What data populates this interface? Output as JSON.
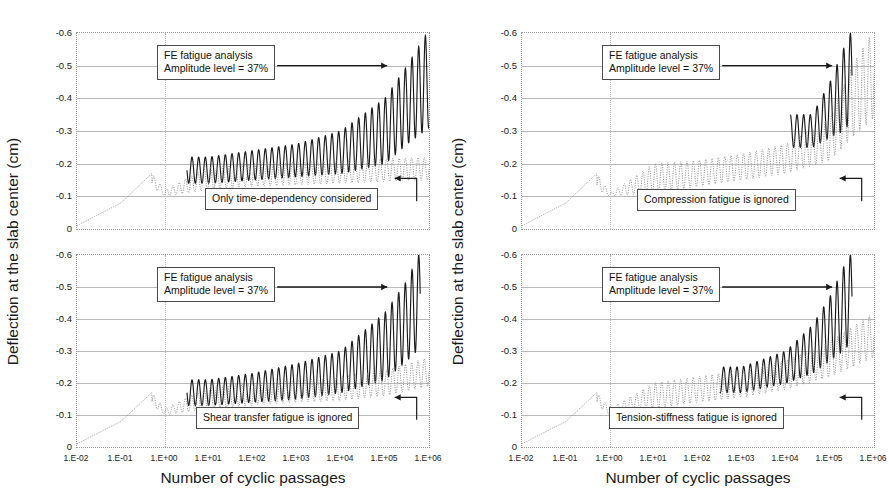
{
  "figure": {
    "width": 889,
    "height": 503,
    "panel_count": 4
  },
  "axes": {
    "ylabel": "Deflection at the slab center (cm)",
    "xlabel": "Number of cyclic passages",
    "yticks": [
      "-0.6",
      "-0.5",
      "-0.4",
      "-0.3",
      "-0.2",
      "-0.1",
      "0"
    ],
    "ytick_values": [
      -0.6,
      -0.5,
      -0.4,
      -0.3,
      -0.2,
      -0.1,
      0
    ],
    "xticks_left": [
      "1.E-02",
      "1.E-01",
      "1.E+00",
      "1.E+01",
      "1.E+02",
      "1.E+03",
      "1.E+04",
      "1.E+05",
      "1.E+06"
    ],
    "xticks_right": [
      "1.E-02",
      "1.E-01",
      "1.E+00",
      "1.E+01",
      "1.E+02",
      "1.E+03",
      "1.E+04",
      "1.E+05",
      "1.E+06"
    ],
    "xtick_values": [
      -2,
      -1,
      0,
      1,
      2,
      3,
      4,
      5,
      6
    ],
    "xlim": [
      -2,
      6
    ],
    "ylim": [
      0,
      -0.6
    ],
    "y_inverted": true,
    "x_scale": "log",
    "grid": "horizontal-solid-plus-vertical-at-1E+00"
  },
  "colors": {
    "solid_series": "#1a1a1a",
    "dotted_series": "#8a8a8a",
    "gridline": "#b9b9b9",
    "axis_border": "#9a9a9a",
    "callout_border": "#4a4a4a",
    "text": "#1a1a1a",
    "background": "#ffffff"
  },
  "legend_labels": {
    "solid": "FE fatigue analysis",
    "dotted_generic": "reference case"
  },
  "panels": [
    {
      "id": "top-left",
      "position": "top-left",
      "callout_main": {
        "line1": "FE fatigue analysis",
        "line2": "Amplitude level = 37%"
      },
      "callout_secondary": "Only time-dependency considered",
      "chart_data": {
        "type": "line",
        "title": "",
        "xlabel": "Number of cyclic passages",
        "ylabel": "Deflection at the slab center (cm)",
        "xlim": [
          -2,
          6
        ],
        "ylim": [
          0,
          -0.6
        ],
        "x_scale": "log",
        "grid": true,
        "legend_position": "annotation-callouts",
        "series": [
          {
            "name": "FE fatigue analysis (Amplitude level = 37%)",
            "style": "solid",
            "color": "#1a1a1a",
            "description": "Oscillating deflection envelope; starts branching from dotted baseline near 1.E+01, peaks grow from -0.22 to -0.61 at 1.E+06",
            "envelope_x": [
              1,
              2,
              3,
              4,
              5,
              5.5,
              6
            ],
            "envelope_peak": [
              -0.22,
              -0.24,
              -0.26,
              -0.3,
              -0.4,
              -0.5,
              -0.61
            ],
            "envelope_trough": [
              -0.14,
              -0.15,
              -0.16,
              -0.17,
              -0.2,
              -0.26,
              -0.31
            ]
          },
          {
            "name": "Only time-dependency considered",
            "style": "dotted",
            "color": "#8a8a8a",
            "description": "Baseline oscillation staying near -0.14 to -0.22 throughout",
            "envelope_x": [
              -2,
              -1,
              -0.3,
              0,
              1,
              2,
              3,
              4,
              5,
              6
            ],
            "envelope_peak": [
              -0.01,
              -0.08,
              -0.17,
              -0.12,
              -0.19,
              -0.2,
              -0.205,
              -0.21,
              -0.215,
              -0.22
            ],
            "envelope_trough": [
              -0.01,
              -0.07,
              -0.13,
              -0.1,
              -0.12,
              -0.13,
              -0.135,
              -0.14,
              -0.145,
              -0.15
            ]
          }
        ]
      }
    },
    {
      "id": "bottom-left",
      "position": "bottom-left",
      "callout_main": {
        "line1": "FE fatigue analysis",
        "line2": "Amplitude level = 37%"
      },
      "callout_secondary": "Shear transfer fatigue is ignored",
      "chart_data": {
        "type": "line",
        "title": "",
        "xlabel": "Number of cyclic passages",
        "ylabel": "Deflection at the slab center (cm)",
        "xlim": [
          -2,
          6
        ],
        "ylim": [
          0,
          -0.6
        ],
        "x_scale": "log",
        "grid": true,
        "legend_position": "annotation-callouts",
        "series": [
          {
            "name": "FE fatigue analysis (Amplitude level = 37%)",
            "style": "solid",
            "color": "#1a1a1a",
            "description": "Branches upward from 1.E+01, peaks rise to -0.61 near 1.E+05.5",
            "envelope_x": [
              1,
              2,
              3,
              4,
              5,
              5.5,
              5.8
            ],
            "envelope_peak": [
              -0.21,
              -0.23,
              -0.26,
              -0.3,
              -0.42,
              -0.52,
              -0.61
            ],
            "envelope_trough": [
              -0.13,
              -0.14,
              -0.15,
              -0.17,
              -0.21,
              -0.27,
              -0.31
            ]
          },
          {
            "name": "Shear transfer fatigue is ignored",
            "style": "dotted",
            "color": "#8a8a8a",
            "description": "Baseline oscillation growing slowly to about -0.28 at 1.E+06",
            "envelope_x": [
              -2,
              -1,
              -0.3,
              0,
              1,
              2,
              3,
              4,
              5,
              6
            ],
            "envelope_peak": [
              -0.01,
              -0.08,
              -0.17,
              -0.12,
              -0.19,
              -0.2,
              -0.21,
              -0.22,
              -0.24,
              -0.28
            ],
            "envelope_trough": [
              -0.01,
              -0.07,
              -0.13,
              -0.1,
              -0.12,
              -0.13,
              -0.14,
              -0.145,
              -0.16,
              -0.19
            ]
          }
        ]
      }
    },
    {
      "id": "top-right",
      "position": "top-right",
      "callout_main": {
        "line1": "FE fatigue analysis",
        "line2": "Amplitude level = 37%"
      },
      "callout_secondary": "Compression fatigue is ignored",
      "chart_data": {
        "type": "line",
        "title": "",
        "xlabel": "Number of cyclic passages",
        "ylabel": "Deflection at the slab center (cm)",
        "xlim": [
          -2,
          6
        ],
        "ylim": [
          0,
          -0.6
        ],
        "x_scale": "log",
        "grid": true,
        "legend_position": "annotation-callouts",
        "series": [
          {
            "name": "FE fatigue analysis (Amplitude level = 37%)",
            "style": "solid",
            "color": "#1a1a1a",
            "description": "Solid curve only visible at far right, rising steeply from -0.35 to -0.61 beyond 1.E+05",
            "envelope_x": [
              4.6,
              5,
              5.3,
              5.5
            ],
            "envelope_peak": [
              -0.35,
              -0.45,
              -0.55,
              -0.61
            ],
            "envelope_trough": [
              -0.25,
              -0.28,
              -0.3,
              -0.33
            ]
          },
          {
            "name": "Compression fatigue is ignored",
            "style": "dotted",
            "color": "#8a8a8a",
            "description": "Dominant dotted oscillation; amplitude grows steadily and reaches full scale near 1.E+06",
            "envelope_x": [
              -2,
              -1,
              -0.3,
              0,
              1,
              2,
              3,
              4,
              5,
              5.5,
              6
            ],
            "envelope_peak": [
              -0.01,
              -0.08,
              -0.17,
              -0.11,
              -0.2,
              -0.21,
              -0.23,
              -0.26,
              -0.34,
              -0.5,
              -0.61
            ],
            "envelope_trough": [
              -0.01,
              -0.07,
              -0.12,
              -0.1,
              -0.11,
              -0.13,
              -0.15,
              -0.17,
              -0.21,
              -0.28,
              -0.34
            ]
          }
        ]
      }
    },
    {
      "id": "bottom-right",
      "position": "bottom-right",
      "callout_main": {
        "line1": "FE fatigue analysis",
        "line2": "Amplitude level = 37%"
      },
      "callout_secondary": "Tension-stiffness fatigue is ignored",
      "chart_data": {
        "type": "line",
        "title": "",
        "xlabel": "Number of cyclic passages",
        "ylabel": "Deflection at the slab center (cm)",
        "xlim": [
          -2,
          6
        ],
        "ylim": [
          0,
          -0.6
        ],
        "x_scale": "log",
        "grid": true,
        "legend_position": "annotation-callouts",
        "series": [
          {
            "name": "FE fatigue analysis (Amplitude level = 37%)",
            "style": "solid",
            "color": "#1a1a1a",
            "description": "Solid peaks emerge from about 1.E+03 and reach -0.61 near 1.E+05.4",
            "envelope_x": [
              3,
              4,
              4.6,
              5,
              5.3,
              5.5
            ],
            "envelope_peak": [
              -0.25,
              -0.3,
              -0.38,
              -0.47,
              -0.56,
              -0.61
            ],
            "envelope_trough": [
              -0.17,
              -0.2,
              -0.23,
              -0.27,
              -0.3,
              -0.33
            ]
          },
          {
            "name": "Tension-stiffness fatigue is ignored",
            "style": "dotted",
            "color": "#8a8a8a",
            "description": "Dotted oscillation grows to about -0.42 peak at 1.E+06",
            "envelope_x": [
              -2,
              -1,
              -0.3,
              0,
              1,
              2,
              3,
              4,
              5,
              6
            ],
            "envelope_peak": [
              -0.01,
              -0.08,
              -0.17,
              -0.12,
              -0.2,
              -0.22,
              -0.24,
              -0.27,
              -0.33,
              -0.42
            ],
            "envelope_trough": [
              -0.01,
              -0.07,
              -0.13,
              -0.1,
              -0.12,
              -0.14,
              -0.155,
              -0.18,
              -0.22,
              -0.28
            ]
          }
        ]
      }
    }
  ]
}
